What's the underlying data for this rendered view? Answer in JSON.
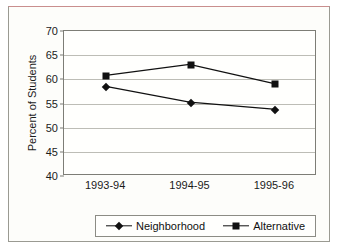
{
  "chart_data": {
    "type": "line",
    "title": "",
    "xlabel": "",
    "ylabel": "Percent of Students",
    "categories": [
      "1993-94",
      "1994-95",
      "1995-96"
    ],
    "ylim": [
      40,
      70
    ],
    "yticks": [
      40,
      45,
      50,
      55,
      60,
      65,
      70
    ],
    "ytick_labels": [
      "40",
      "45",
      "50",
      "55",
      "60",
      "65",
      "70"
    ],
    "grid": true,
    "legend_position": "bottom",
    "series": [
      {
        "name": "Neighborhood",
        "marker": "diamond",
        "color": "#111111",
        "values": [
          58.4,
          55.1,
          53.6
        ]
      },
      {
        "name": "Alternative",
        "marker": "square",
        "color": "#111111",
        "values": [
          60.7,
          63.0,
          59.0
        ]
      }
    ]
  }
}
